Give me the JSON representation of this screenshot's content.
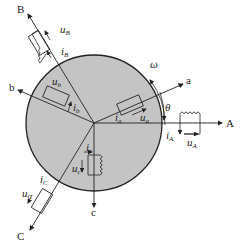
{
  "diagram": {
    "title": "",
    "type": "three-phase machine winding schematic",
    "rotor": {
      "fill": "#c4c4c4",
      "stroke": "#222222"
    },
    "stator_axes": [
      {
        "name": "A",
        "label": "A",
        "voltage": "u",
        "voltage_sub": "A",
        "current": "i",
        "current_sub": "A"
      },
      {
        "name": "B",
        "label": "B",
        "voltage": "u",
        "voltage_sub": "B",
        "current": "i",
        "current_sub": "B"
      },
      {
        "name": "C",
        "label": "C",
        "voltage": "u",
        "voltage_sub": "C",
        "current": "i",
        "current_sub": "C"
      }
    ],
    "rotor_axes": [
      {
        "name": "a",
        "label": "a",
        "voltage": "u",
        "voltage_sub": "a",
        "current": "i",
        "current_sub": "a"
      },
      {
        "name": "b",
        "label": "b",
        "voltage": "u",
        "voltage_sub": "b",
        "current": "i",
        "current_sub": "b"
      },
      {
        "name": "c",
        "label": "c",
        "voltage": "u",
        "voltage_sub": "c",
        "current": "i",
        "current_sub": "c"
      }
    ],
    "angular_velocity": "ω",
    "angle": "θ"
  }
}
